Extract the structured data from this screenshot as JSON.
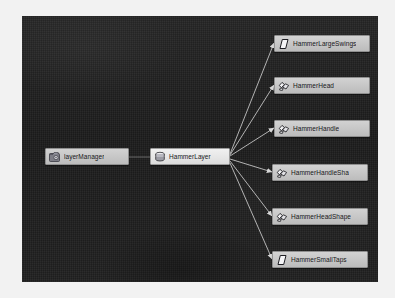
{
  "app": {
    "view_name": "hypergraph-dependency-view",
    "canvas_background": "#1b1b1b",
    "node_fill": "#c6c6c6",
    "node_border": "#8f8f8f",
    "edge_color": "#c9c9c9",
    "node_text_color": "#17171a"
  },
  "nodes": {
    "layer_manager": {
      "label": "layerManager",
      "icon": "layer-manager-icon"
    },
    "hammer_layer": {
      "label": "HammerLayer",
      "icon": "layer-stack-icon"
    },
    "children": [
      {
        "label": "HammerLargeSwings",
        "icon": "parallelogram-icon"
      },
      {
        "label": "HammerHead",
        "icon": "polygon-shape-icon"
      },
      {
        "label": "HammerHandle",
        "icon": "polygon-shape-icon"
      },
      {
        "label": "HammerHandleSha",
        "icon": "polygon-shape-icon"
      },
      {
        "label": "HammerHeadShape",
        "icon": "polygon-shape-icon"
      },
      {
        "label": "HammerSmallTaps",
        "icon": "parallelogram-icon"
      }
    ]
  }
}
